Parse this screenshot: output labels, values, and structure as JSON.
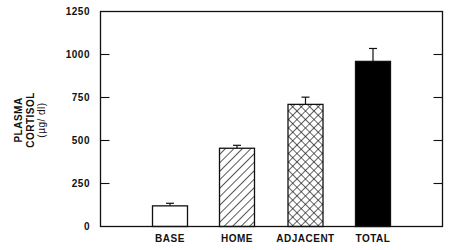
{
  "chart_data": {
    "type": "bar",
    "title": "",
    "xlabel": "",
    "ylabel": "PLASMA CORTISOL (µg/dl)",
    "ylabel_lines": [
      "PLASMA",
      "CORTISOL",
      "(µg/ dl)"
    ],
    "categories": [
      "BASE",
      "HOME",
      "ADJACENT",
      "TOTAL"
    ],
    "values": [
      120,
      455,
      710,
      960
    ],
    "error_upper": [
      135,
      472,
      752,
      1035
    ],
    "fill_patterns": [
      "empty",
      "diagonal-hatch",
      "cross-hatch",
      "solid"
    ],
    "ylim": [
      0,
      1250
    ],
    "yticks": [
      0,
      250,
      500,
      750,
      1000,
      1250
    ],
    "grid": false,
    "legend": null,
    "colors": {
      "axis": "#111111",
      "bar_stroke": "#111111",
      "solid_fill": "#000000",
      "background": "#ffffff"
    }
  }
}
